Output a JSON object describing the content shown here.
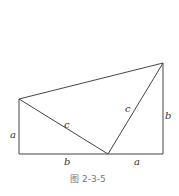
{
  "figure": {
    "caption": "图 2-3-5",
    "labels": {
      "left_side": "a",
      "bottom_left": "b",
      "bottom_right": "a",
      "right_side": "b",
      "hyp_left": "c",
      "hyp_right": "c"
    },
    "colors": {
      "stroke": "#444444",
      "label": "#333333",
      "caption": "#777777"
    }
  }
}
